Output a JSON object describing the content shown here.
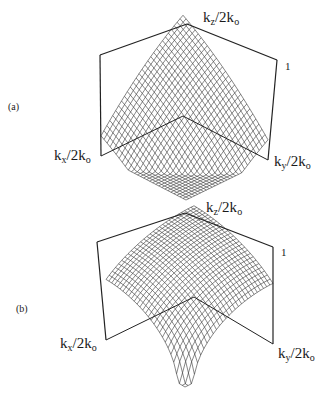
{
  "figure": {
    "panels": [
      {
        "id": "a",
        "label": "(a)",
        "axes": {
          "kz": {
            "base": "k",
            "sub": "z",
            "tail": "/2k",
            "tail_sub": "o"
          },
          "kx": {
            "base": "k",
            "sub": "x",
            "tail": "/2k",
            "tail_sub": "o"
          },
          "ky": {
            "base": "k",
            "sub": "y",
            "tail": "/2k",
            "tail_sub": "o"
          },
          "tick": "1"
        },
        "geometry": {
          "apex": [
            187,
            24
          ],
          "top_left": [
            100,
            55
          ],
          "top_right": [
            277,
            60
          ],
          "bot_left": [
            101,
            156
          ],
          "bot_right": [
            268,
            160
          ],
          "bottom": [
            186,
            200
          ],
          "shape": "peaked"
        }
      },
      {
        "id": "b",
        "label": "(b)",
        "axes": {
          "kz": {
            "base": "k",
            "sub": "z",
            "tail": "/2k",
            "tail_sub": "o"
          },
          "kx": {
            "base": "k",
            "sub": "x",
            "tail": "/2k",
            "tail_sub": "o"
          },
          "ky": {
            "base": "k",
            "sub": "y",
            "tail": "/2k",
            "tail_sub": "o"
          },
          "tick": "1"
        },
        "geometry": {
          "apex": [
            185,
            213
          ],
          "top_left": [
            97,
            242
          ],
          "top_right": [
            273,
            247
          ],
          "bot_left": [
            106,
            340
          ],
          "bot_right": [
            273,
            344
          ],
          "bottom": [
            185,
            387
          ],
          "shape": "dome"
        }
      }
    ]
  },
  "chart_data": [
    {
      "type": "surface",
      "title": "(a)",
      "xlabel": "kx/2ko",
      "ylabel": "ky/2ko",
      "zlabel": "kz/2ko",
      "zlim": [
        0,
        1
      ],
      "grid": true,
      "description": "peaked wireframe surface over square base"
    },
    {
      "type": "surface",
      "title": "(b)",
      "xlabel": "kx/2ko",
      "ylabel": "ky/2ko",
      "zlabel": "kz/2ko",
      "zlim": [
        0,
        1
      ],
      "grid": true,
      "description": "dome-shaped wireframe surface over square base"
    }
  ]
}
